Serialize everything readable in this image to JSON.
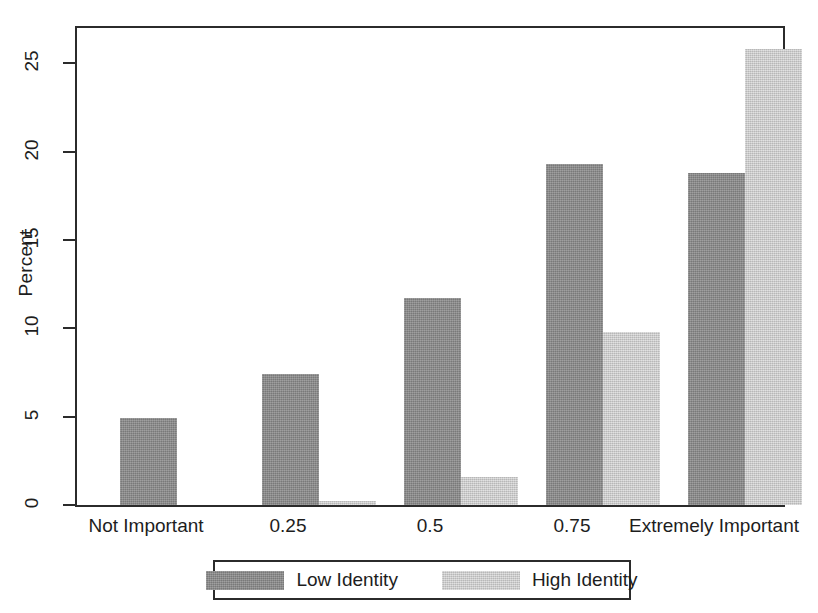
{
  "chart_data": {
    "type": "bar",
    "title": "",
    "subtitle": "",
    "xlabel": "",
    "ylabel": "Percent",
    "categories": [
      "Not Important",
      "0.25",
      "0.5",
      "0.75",
      "Extremely Important"
    ],
    "series": [
      {
        "name": "Low Identity",
        "color": "#8a8a8a",
        "values": [
          4.9,
          7.4,
          11.7,
          19.3,
          18.8
        ]
      },
      {
        "name": "High Identity",
        "color": "#d0d0d0",
        "values": [
          0,
          0.2,
          1.6,
          9.8,
          25.8
        ]
      }
    ],
    "ylim": [
      0,
      27
    ],
    "yticks": [
      0,
      5,
      10,
      15,
      20,
      25
    ],
    "ytick_labels": [
      "0",
      "5",
      "10",
      "15",
      "20",
      "25"
    ],
    "grid": false,
    "legend_position": "bottom",
    "legend_entries": [
      "Low Identity",
      "High Identity"
    ],
    "frame": "box"
  }
}
